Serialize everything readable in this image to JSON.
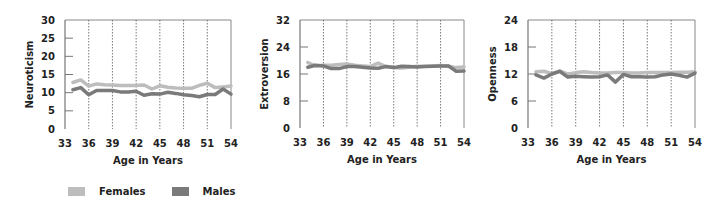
{
  "legend": {
    "items": [
      {
        "label": "Females",
        "color": "#bdbdbd"
      },
      {
        "label": "Males",
        "color": "#7a7a7a"
      }
    ]
  },
  "chart_data": [
    {
      "type": "line",
      "title": "",
      "xlabel": "Age in Years",
      "ylabel": "Neuroticism",
      "ylim": [
        0,
        30
      ],
      "yticks": [
        0,
        5,
        10,
        15,
        20,
        25,
        30
      ],
      "xlim": [
        33,
        54
      ],
      "xticks": [
        33,
        36,
        39,
        42,
        45,
        48,
        51,
        54
      ],
      "grid": "vertical dotted",
      "x": [
        34,
        35,
        36,
        37,
        38,
        39,
        40,
        41,
        42,
        43,
        44,
        45,
        46,
        47,
        48,
        49,
        50,
        51,
        52,
        53,
        54
      ],
      "series": [
        {
          "name": "Females",
          "color": "#bdbdbd",
          "values": [
            12.8,
            13.5,
            11.8,
            12.4,
            12.2,
            12.1,
            12.0,
            12.0,
            12.0,
            12.1,
            11.0,
            11.9,
            11.5,
            11.3,
            11.2,
            11.2,
            12.0,
            12.6,
            11.4,
            11.6,
            11.8
          ]
        },
        {
          "name": "Males",
          "color": "#7a7a7a",
          "values": [
            10.8,
            11.4,
            9.4,
            10.6,
            10.6,
            10.6,
            10.2,
            10.2,
            10.4,
            9.3,
            9.7,
            9.6,
            10.1,
            9.8,
            9.4,
            9.2,
            8.9,
            9.5,
            9.5,
            11.0,
            9.6
          ]
        }
      ]
    },
    {
      "type": "line",
      "title": "",
      "xlabel": "Age in Years",
      "ylabel": "Extroversion",
      "ylim": [
        0,
        32
      ],
      "yticks": [
        0,
        8,
        16,
        24,
        32
      ],
      "xlim": [
        33,
        54
      ],
      "xticks": [
        33,
        36,
        39,
        42,
        45,
        48,
        51,
        54
      ],
      "grid": "vertical dotted",
      "x": [
        34,
        35,
        36,
        37,
        38,
        39,
        40,
        41,
        42,
        43,
        44,
        45,
        46,
        47,
        48,
        49,
        50,
        51,
        52,
        53,
        54
      ],
      "series": [
        {
          "name": "Females",
          "color": "#bdbdbd",
          "values": [
            19.4,
            18.4,
            18.6,
            18.6,
            18.8,
            19.0,
            18.6,
            18.4,
            18.2,
            19.2,
            18.2,
            17.9,
            17.8,
            18.0,
            18.3,
            18.3,
            18.4,
            18.5,
            18.3,
            17.9,
            18.1
          ]
        },
        {
          "name": "Males",
          "color": "#7a7a7a",
          "values": [
            18.0,
            18.6,
            18.4,
            17.6,
            17.6,
            18.2,
            18.2,
            18.0,
            17.8,
            17.7,
            18.2,
            17.9,
            18.3,
            18.2,
            18.1,
            18.2,
            18.3,
            18.4,
            18.4,
            16.8,
            16.9
          ]
        }
      ]
    },
    {
      "type": "line",
      "title": "",
      "xlabel": "Age in Years",
      "ylabel": "Openness",
      "ylim": [
        0,
        24
      ],
      "yticks": [
        0,
        6,
        12,
        18,
        24
      ],
      "xlim": [
        33,
        54
      ],
      "xticks": [
        33,
        36,
        39,
        42,
        45,
        48,
        51,
        54
      ],
      "grid": "vertical dotted",
      "x": [
        34,
        35,
        36,
        37,
        38,
        39,
        40,
        41,
        42,
        43,
        44,
        45,
        46,
        47,
        48,
        49,
        50,
        51,
        52,
        53,
        54
      ],
      "series": [
        {
          "name": "Females",
          "color": "#bdbdbd",
          "values": [
            12.5,
            12.6,
            12.1,
            12.7,
            12.0,
            12.3,
            12.5,
            12.3,
            12.2,
            12.2,
            12.3,
            12.3,
            12.2,
            12.2,
            12.3,
            12.3,
            12.3,
            12.3,
            12.4,
            12.4,
            12.5
          ]
        },
        {
          "name": "Males",
          "color": "#7a7a7a",
          "values": [
            11.8,
            11.1,
            12.0,
            12.6,
            11.3,
            11.5,
            11.4,
            11.3,
            11.4,
            11.8,
            10.2,
            11.9,
            11.4,
            11.4,
            11.3,
            11.4,
            11.8,
            12.0,
            11.7,
            11.3,
            12.2
          ]
        }
      ]
    }
  ]
}
